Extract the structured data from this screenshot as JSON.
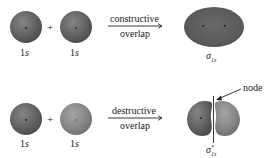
{
  "colors": {
    "background": "#ffffff",
    "orbital_dark": "#5f5f5f",
    "orbital_mid": "#7a7a7a",
    "orbital_light": "#8e8e8e",
    "text": "#222222"
  },
  "top_row": {
    "orbital_a": {
      "label_num": "1",
      "label_sub": "s"
    },
    "plus": "+",
    "orbital_b": {
      "label_num": "1",
      "label_sub": "s"
    },
    "arrow_top": "constructive",
    "arrow_bottom": "overlap",
    "result": {
      "symbol": "σ",
      "subscript": "1s",
      "superscript": ""
    }
  },
  "bottom_row": {
    "orbital_a": {
      "label_num": "1",
      "label_sub": "s"
    },
    "plus": "+",
    "orbital_b": {
      "label_num": "1",
      "label_sub": "s"
    },
    "arrow_top": "destructive",
    "arrow_bottom": "overlap",
    "result": {
      "symbol": "σ",
      "subscript": "1s",
      "superscript": "*"
    },
    "node_label": "node"
  }
}
